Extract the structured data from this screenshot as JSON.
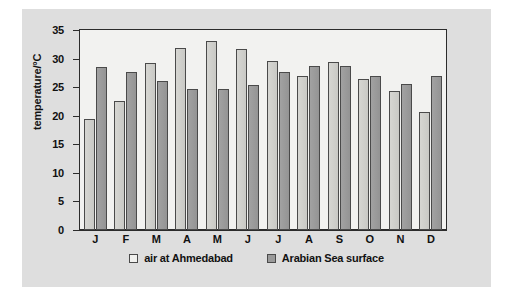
{
  "figure": {
    "background_color": "#dedede",
    "plot_background_color": "#f2f2f0",
    "axis_color": "#2b2b2b"
  },
  "chart_data": {
    "type": "bar",
    "title": "",
    "subtitle": "",
    "xlabel": "",
    "ylabel": "temperature/°C",
    "ylim": [
      0,
      35
    ],
    "yticks": [
      0,
      5,
      10,
      15,
      20,
      25,
      30,
      35
    ],
    "ytick_labels": [
      "0",
      "5",
      "10",
      "15",
      "20",
      "25",
      "30",
      "35"
    ],
    "grid": false,
    "legend_position": "bottom-center",
    "categories": [
      "J",
      "F",
      "M",
      "A",
      "M",
      "J",
      "J",
      "A",
      "S",
      "O",
      "N",
      "D"
    ],
    "series": [
      {
        "name": "air at Ahmedabad",
        "color": "#cfcfcb",
        "values": [
          19.5,
          22.6,
          29.2,
          31.9,
          33.0,
          31.6,
          29.6,
          27.0,
          29.4,
          26.4,
          24.4,
          20.6
        ]
      },
      {
        "name": "Arabian Sea surface",
        "color": "#9a9a9a",
        "values": [
          28.5,
          27.6,
          26.0,
          24.6,
          24.7,
          25.3,
          27.6,
          28.7,
          28.7,
          26.9,
          25.5,
          26.9
        ]
      }
    ]
  },
  "legend": {
    "items": [
      {
        "label": "air at Ahmedabad",
        "swatch": "air"
      },
      {
        "label": "Arabian Sea surface",
        "swatch": "sea"
      }
    ]
  }
}
